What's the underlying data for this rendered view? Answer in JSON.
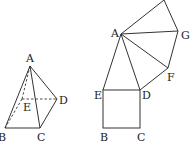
{
  "figures": {
    "pyramid": {
      "labels": {
        "A": "A",
        "B": "B",
        "C": "C",
        "D": "D",
        "E": "E"
      },
      "description": "Pyramid A-BCDE with hidden edges AE, EB, ED dashed"
    },
    "unfolded": {
      "labels": {
        "A": "A",
        "B": "B",
        "C": "C",
        "D": "D",
        "E": "E",
        "F": "F",
        "G": "G"
      },
      "description": "Net: square BCDE with triangles AED, ADF, AFG, and a fourth triangle on AG"
    }
  }
}
